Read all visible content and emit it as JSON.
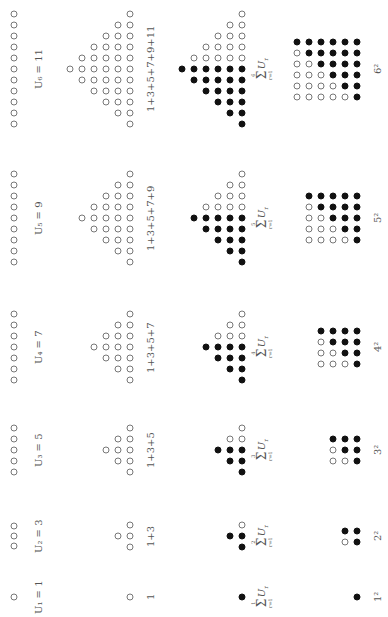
{
  "diagram": {
    "orientation": "rotated-90-ccw",
    "colors": {
      "open_stroke": "#777777",
      "filled": "#111111",
      "text": "#555555",
      "background": "#ffffff"
    },
    "rows": {
      "odd_number": {
        "x_dot": 14,
        "x_label": 38
      },
      "triangle": {
        "x_base": 130,
        "x_label": 150
      },
      "sum_triangle": {
        "x_base": 242,
        "x_label": 262
      },
      "square": {
        "x_right": 357,
        "x_label": 377
      }
    },
    "groups": [
      {
        "n": 1,
        "y": 597,
        "odd": 1,
        "odd_label": "U₁ = 1",
        "triangle_label": "1",
        "sum_upper": "1",
        "square_label": "1²"
      },
      {
        "n": 2,
        "y": 536,
        "odd": 3,
        "odd_label": "U₂ = 3",
        "triangle_label": "1+3",
        "sum_upper": "2",
        "square_label": "2²"
      },
      {
        "n": 3,
        "y": 450,
        "odd": 5,
        "odd_label": "U₃ = 5",
        "triangle_label": "1+3+5",
        "sum_upper": "3",
        "square_label": "3²"
      },
      {
        "n": 4,
        "y": 347,
        "odd": 7,
        "odd_label": "U₄ = 7",
        "triangle_label": "1+3+5+7",
        "sum_upper": "4",
        "square_label": "4²"
      },
      {
        "n": 5,
        "y": 218,
        "odd": 9,
        "odd_label": "U₅ = 9",
        "triangle_label": "1+3+5+7+9",
        "sum_upper": "5",
        "square_label": "5²"
      },
      {
        "n": 6,
        "y": 69,
        "odd": 11,
        "odd_label": "U₆ = 11",
        "triangle_label": "1+3+5+7+9+11",
        "sum_upper": "6",
        "square_label": "6²"
      }
    ],
    "sum_label": {
      "symbol": "Σ",
      "lower": "r=1",
      "term": "U",
      "term_sub": "r"
    },
    "spacing": {
      "dot_step_y": 11,
      "dot_step_x": 12
    }
  }
}
